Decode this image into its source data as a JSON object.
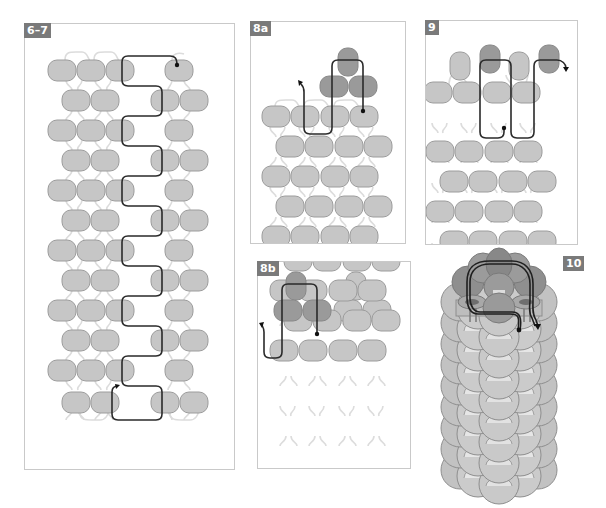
{
  "figure": {
    "colors": {
      "bead_light": "#c6c6c6",
      "bead_dark": "#9a9a9a",
      "bead_stroke": "#9c9c9c",
      "thread_light": "#dcdcdc",
      "thread_path": "#2a2a2a",
      "panel_border": "#c9c9c9",
      "label_bg": "#7a7a7a"
    },
    "panels": [
      {
        "id": "6-7",
        "label": "6–7"
      },
      {
        "id": "8a",
        "label": "8a"
      },
      {
        "id": "9",
        "label": "9"
      },
      {
        "id": "8b",
        "label": "8b"
      },
      {
        "id": "10",
        "label": "10"
      }
    ]
  }
}
